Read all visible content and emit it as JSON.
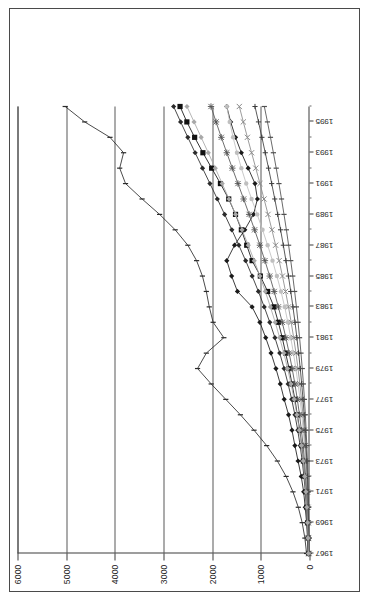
{
  "chart_data": {
    "type": "line",
    "title": "",
    "xlabel": "",
    "ylabel": "",
    "ylim": [
      0,
      6000
    ],
    "grid": true,
    "legend_position": "top-center",
    "orientation": "rotated-90",
    "y_ticks": [
      0,
      1000,
      2000,
      3000,
      4000,
      5000,
      6000
    ],
    "y_tick_labels": [
      "0",
      "1000",
      "2000",
      "3000",
      "4000",
      "5000",
      "6000"
    ],
    "x": [
      1967,
      1968,
      1969,
      1970,
      1971,
      1972,
      1973,
      1974,
      1975,
      1976,
      1977,
      1978,
      1979,
      1980,
      1981,
      1982,
      1983,
      1984,
      1985,
      1986,
      1987,
      1988,
      1989,
      1990,
      1991,
      1992,
      1993,
      1994,
      1995,
      1996
    ],
    "x_tick_labels": [
      "1967",
      "1969",
      "1971",
      "1973",
      "1975",
      "1977",
      "1979",
      "1981",
      "1983",
      "1985",
      "1987",
      "1989",
      "1991",
      "1993",
      "1995"
    ],
    "series": [
      {
        "name": "CONST. PROD.",
        "marker": "diamond-filled",
        "color": "#1a1a1a",
        "values": [
          30,
          42,
          60,
          88,
          120,
          170,
          235,
          300,
          360,
          430,
          520,
          600,
          690,
          790,
          900,
          1020,
          1180,
          1480,
          1600,
          1700,
          1540,
          1330,
          1150,
          1070,
          1120,
          1260,
          1400,
          1520,
          1620,
          1700
        ]
      },
      {
        "name": "BASIC METALS",
        "marker": "square-filled",
        "color": "#111111",
        "values": [
          20,
          28,
          40,
          55,
          72,
          95,
          125,
          160,
          200,
          250,
          300,
          360,
          420,
          490,
          560,
          640,
          730,
          860,
          1010,
          1180,
          1290,
          1400,
          1520,
          1660,
          1830,
          2010,
          2190,
          2360,
          2520,
          2660
        ]
      },
      {
        "name": "TEXTILES",
        "marker": "dot-light",
        "color": "#bfbfbf",
        "values": [
          15,
          20,
          27,
          36,
          48,
          63,
          82,
          104,
          130,
          160,
          195,
          235,
          280,
          330,
          385,
          445,
          510,
          585,
          670,
          760,
          860,
          965,
          1075,
          1190,
          1300,
          1400,
          1490,
          1570,
          1640,
          1700
        ]
      },
      {
        "name": "WOOD PAPER",
        "marker": "x",
        "color": "#8a8a8a",
        "values": [
          12,
          16,
          22,
          30,
          40,
          52,
          68,
          86,
          108,
          134,
          164,
          198,
          236,
          278,
          325,
          376,
          432,
          492,
          556,
          624,
          696,
          772,
          852,
          934,
          1018,
          1104,
          1190,
          1276,
          1360,
          1442
        ]
      },
      {
        "name": "METAL PROD.",
        "marker": "star",
        "color": "#555555",
        "values": [
          18,
          24,
          33,
          45,
          60,
          80,
          104,
          132,
          166,
          205,
          250,
          300,
          356,
          418,
          486,
          560,
          640,
          726,
          818,
          916,
          1020,
          1128,
          1240,
          1354,
          1470,
          1586,
          1700,
          1812,
          1920,
          2024
        ]
      },
      {
        "name": "CHEMICALS",
        "marker": "diamond-filled",
        "color": "#2b2b2b",
        "values": [
          25,
          34,
          47,
          64,
          86,
          114,
          150,
          192,
          242,
          300,
          366,
          440,
          522,
          612,
          710,
          816,
          930,
          1050,
          1178,
          1312,
          1452,
          1596,
          1744,
          1894,
          2046,
          2198,
          2350,
          2500,
          2648,
          2792
        ]
      },
      {
        "name": "MINING",
        "marker": "plus",
        "color": "#3d3d3d",
        "values": [
          10,
          13,
          18,
          24,
          32,
          42,
          55,
          70,
          88,
          109,
          133,
          160,
          190,
          223,
          259,
          298,
          340,
          385,
          433,
          484,
          538,
          594,
          653,
          714,
          777,
          842,
          909,
          978,
          1048,
          1120
        ]
      },
      {
        "name": "ENERGY",
        "marker": "bar",
        "color": "#4f4f4f",
        "values": [
          8,
          10,
          14,
          19,
          25,
          33,
          43,
          55,
          69,
          85,
          104,
          125,
          149,
          175,
          204,
          235,
          269,
          305,
          344,
          385,
          429,
          475,
          524,
          575,
          628,
          684,
          742,
          802,
          864,
          928
        ]
      },
      {
        "name": "AGRICULTURE",
        "marker": "bar-dark",
        "color": "#2a2a2a",
        "values": [
          60,
          95,
          150,
          230,
          340,
          480,
          660,
          880,
          1140,
          1420,
          1720,
          2020,
          2300,
          2120,
          1760,
          1980,
          2060,
          2120,
          2200,
          2320,
          2500,
          2760,
          3080,
          3440,
          3780,
          3900,
          3820,
          4100,
          4620,
          5020
        ]
      },
      {
        "name": "FOOD BEV.T.",
        "marker": "diamond-light",
        "color": "#a8a8a8",
        "values": [
          22,
          30,
          41,
          56,
          75,
          99,
          129,
          165,
          208,
          258,
          315,
          379,
          450,
          528,
          613,
          705,
          803,
          908,
          1019,
          1136,
          1258,
          1386,
          1518,
          1654,
          1794,
          1936,
          2080,
          2226,
          2372,
          2518
        ]
      }
    ]
  }
}
